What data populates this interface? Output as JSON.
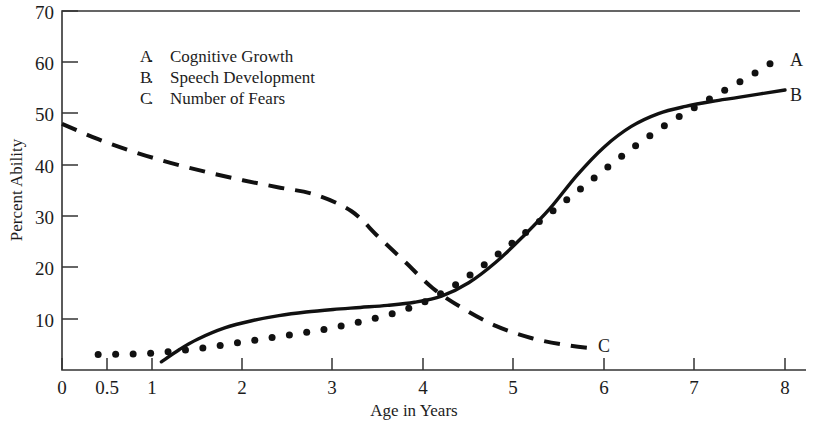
{
  "chart_data": {
    "type": "line",
    "title": "",
    "xlabel": "Age in Years",
    "ylabel": "Percent Ability",
    "xlim": [
      0,
      8
    ],
    "ylim": [
      0,
      70
    ],
    "grid": false,
    "legend_position": "upper-left-inside",
    "x_ticks": [
      "0",
      "0.5",
      "1",
      "2",
      "3",
      "4",
      "5",
      "6",
      "7",
      "8"
    ],
    "x_tick_values": [
      0,
      0.5,
      1,
      2,
      3,
      4,
      5,
      6,
      7,
      8
    ],
    "y_ticks": [
      "10",
      "20",
      "30",
      "40",
      "50",
      "60",
      "70"
    ],
    "y_tick_values": [
      10,
      20,
      30,
      40,
      50,
      60,
      70
    ],
    "legend": [
      {
        "key": "A",
        "label": "Cognitive Growth"
      },
      {
        "key": "B",
        "label": "Speech Development"
      },
      {
        "key": "C",
        "label": "Number of Fears"
      }
    ],
    "series": [
      {
        "name": "Cognitive Growth",
        "key": "A",
        "style": "dotted",
        "end_label": "A",
        "x": [
          0.4,
          0.7,
          1.0,
          1.3,
          1.6,
          1.9,
          2.2,
          2.5,
          2.8,
          3.1,
          3.4,
          3.7,
          4.0,
          4.3,
          4.6,
          4.9,
          5.2,
          5.5,
          5.8,
          6.1,
          6.4,
          6.7,
          7.0,
          7.3,
          7.6,
          7.9
        ],
        "values": [
          3.0,
          3.1,
          3.3,
          3.8,
          4.4,
          5.2,
          6.0,
          6.8,
          7.6,
          8.6,
          9.8,
          11.2,
          13.2,
          16.0,
          19.6,
          23.6,
          27.8,
          32.0,
          36.2,
          40.4,
          44.4,
          48.0,
          51.2,
          54.2,
          57.2,
          60.4
        ]
      },
      {
        "name": "Speech Development",
        "key": "B",
        "style": "solid",
        "end_label": "B",
        "x": [
          1.1,
          1.3,
          1.5,
          1.8,
          2.1,
          2.4,
          2.7,
          3.0,
          3.3,
          3.6,
          3.9,
          4.2,
          4.5,
          4.8,
          5.1,
          5.4,
          5.7,
          6.0,
          6.3,
          6.6,
          6.9,
          7.2,
          7.5,
          8.0
        ],
        "values": [
          1.6,
          4.0,
          6.0,
          8.2,
          9.6,
          10.6,
          11.3,
          11.8,
          12.2,
          12.6,
          13.2,
          14.4,
          17.0,
          21.0,
          26.0,
          31.5,
          38.0,
          43.5,
          47.5,
          50.0,
          51.4,
          52.4,
          53.2,
          54.6
        ]
      },
      {
        "name": "Number of Fears",
        "key": "C",
        "style": "dashed",
        "end_label": "C",
        "x": [
          0.0,
          0.4,
          0.8,
          1.2,
          1.6,
          2.0,
          2.4,
          2.8,
          3.2,
          3.5,
          3.8,
          4.1,
          4.4,
          4.8,
          5.2,
          5.6,
          5.9
        ],
        "values": [
          48.0,
          45.0,
          42.5,
          40.4,
          38.6,
          37.0,
          35.6,
          34.2,
          31.0,
          26.0,
          21.0,
          16.0,
          12.4,
          8.6,
          6.2,
          4.8,
          4.2
        ]
      }
    ]
  },
  "labels": {
    "curve_a": "A",
    "curve_b": "B",
    "curve_c": "C"
  }
}
